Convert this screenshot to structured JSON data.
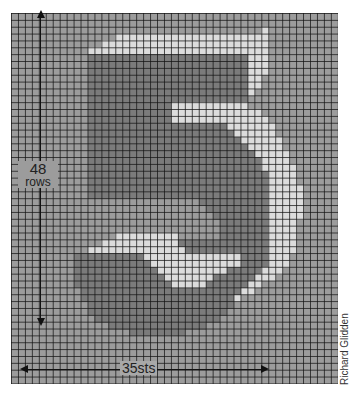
{
  "chart_data": {
    "type": "heatmap",
    "grid": {
      "cols": 47,
      "rows": 54,
      "grid_lines": true
    },
    "legend": {
      "B": {
        "name": "background",
        "color": "#9c9c9c"
      },
      "D": {
        "name": "dark",
        "color": "#7b7b7b"
      },
      "L": {
        "name": "light",
        "color": "#dcdcdc"
      }
    },
    "pattern": [
      "BBBBBBBBBBBBBBBBBBBBBBBBBBBBBBBBBBBBBBBBBBBBBBB",
      "BBBBBBBBBBBBBBBBBBBBBBBBBBBBBBBBBBBBBBBBBBBBBBB",
      "BBBBBBBBBBBBBBBBBBBBBBBBBBBBBBBBBBBBLBBBBBBBBBB",
      "BBBBBBBBBBBBBBBLLLLLLLLLLLLLLLLLLLLLLBBBBBBBBBB",
      "BBBBBBBBBBBBBLLLLLLLLLLLLLLLLLLLLLLLLBBBBBBBBBB",
      "BBBBBBBBBBBLLLLLLLLLLLLLLLLLLLLLLLLLLBBBBBBBBBB",
      "BBBBBBBBBBBDDDDDDDDDDDDDDDDDDDDDDDLLLBBBBBBBBBB",
      "BBBBBBBBBBBDDDDDDDDDDDDDDDDDDDDDDDLLLBBBBBBBBBB",
      "BBBBBBBBBBBDDDDDDDDDDDDDDDDDDDDDDDLLLBBBBBBBBBB",
      "BBBBBBBBBBBDDDDDDDDDDDDDDDDDDDDDDDLLBBBBBBBBBBB",
      "BBBBBBBBBBBDDDDDDDDDDDDDDDDDDDDDDDLLBBBBBBBBBBB",
      "BBBBBBBBBBBDDDDDDDDDDDDDDDDDDDDDDDLBBBBBBBBBBBB",
      "BBBBBBBBBBBDDDDDDDDDDDDDDDDDDDDDDDBBBBBBBBBBBBB",
      "BBBBBBBBBBBDDDDDDDDDDDDLLLLLLLLLLLBBBBBBBBBBBBB",
      "BBBBBBBBBBBDDDDDDDDDDDDLLLLLLLLLLLLLBBBBBBBBBBB",
      "BBBBBBBBBBBDDDDDDDDDDDDLLLLLLLLLLLLLLBBBBBBBBBB",
      "BBBBBBBBBBBDDDDDDDDDDDDDDDDDDDDLLLLLLLBBBBBBBBB",
      "BBBBBBBBBBBDDDDDDDDDDDDDDDDDDDDDLLLLLLBBBBBBBBB",
      "BBBBBBBBBBBDDDDDDDDDDDDDDDDDDDDDDLLLLLLBBBBBBBB",
      "BBBBBBBBBBBDDDDDDDDDDDDDDDDDDDDDDDLLLLLBBBBBBBB",
      "BBBBBBBBBBBDDDDDDDDDDDDDDDDDDDDDDDDLLLLLBBBBBBB",
      "BBBBBBBBBBBDDDDDDDDDDDDDDDDDDDDDDDDDLLLLBBBBBBB",
      "BBBBBBBBBBBDDDDDDDDDDDDDDDDDDDDDDDDDLLLLLBBBBBB",
      "BBBBBBBBBBBDDDDDDDDDDDDDDDDDDDDDDDDDDLLLLBBBBBB",
      "BBBBBBBBBBBDDDDDDDDDDDDDDDDDDDDDDDDDDLLLLBBBBBB",
      "BBBBBBBBBBBDDDDDDDDDDDDDDDDDDDDDDDDDDLLLLLBBBBB",
      "BBBBBBBBBBBDDDDDDDDDDDDDDDDDDDDDDDDDDLLLLLBBBBB",
      "BBBBBBBBBBBBBBBBBBBBBBBBBBBDDDDDDDDDDLLLLLBBBBB",
      "BBBBBBBBBBBBBBBBBBBBBBBBBBBBDDDDDDDDDLLLLLBBBBB",
      "BBBBBBBBBBBBBBBBBBBBBBBBBBBBBDDDDDDDDLLLLLBBBBB",
      "BBBBBBBBBBBBBBBBBBBBBBBBBBBBBBDDDDDDDLLLLBBBBBB",
      "BBBBBBBBBBBBBBBBBBBBBBBBBBBBBBDDDDDDDLLLLBBBBBB",
      "BBBBBBBBBBBBBBBLLLLLLLLLBBBBBBDDDDDDDLLLLBBBBBB",
      "BBBBBBBBBBBBBLLLLLLLLLLLDDDDDDDDDDDDDLLLLBBBBBB",
      "BBBBBBBBBBBLLLLLLLLLLLLLLDDDDDDDDDDDDLLLLBBBBBB",
      "BBBBBBBBBDDDDDDDDDDLLLLLLLLLLLLLLDDDDLLLBBBBBBB",
      "BBBBBBBBBDDDDDDDDDDDLLLLLLLLLLLLLDDDDLLLBBBBBBB",
      "BBBBBBBBBDDDDDDDDDDDDLLLLLLLLLLDDDDDLLLBBBBBBBB",
      "BBBBBBBBBDDDDDDDDDDDDDLLLLLLLDDDDDDLLLBBBBBBBBB",
      "BBBBBBBBBDDDDDDDDDDDDDDLLLLLDDDDDDLLBBBBBBBBBBB",
      "BBBBBBBBBBDDDDDDDDDDDDDDDDDDDDDDDLLBBBBBBBBBBBB",
      "BBBBBBBBBBDDDDDDDDDDDDDDDDDDDDDDLBBBBBBBBBBBBBB",
      "BBBBBBBBBBBDDDDDDDDDDDDDDDDDDDDDBBBBBBBBBBBBBBB",
      "BBBBBBBBBBBDDDDDDDDDDDDDDDDDDDDBBBBBBBBBBBBBBBB",
      "BBBBBBBBBBBBDDDDDDDDDDDDDDDDDDBBBBBBBBBBBBBBBBB",
      "BBBBBBBBBBBBBBDDDDDDDDDDDDDDBBBBBBBBBBBBBBBBBBB",
      "BBBBBBBBBBBBBBBBBDDDDDDDDBBBBBBBBBBBBBBBBBBBBBB",
      "BBBBBBBBBBBBBBBBBBBBBBBBBBBBBBBBBBBBBBBBBBBBBBB",
      "BBBBBBBBBBBBBBBBBBBBBBBBBBBBBBBBBBBBBBBBBBBBBBB",
      "BBBBBBBBBBBBBBBBBBBBBBBBBBBBBBBBBBBBBBBBBBBBBBB",
      "BBBBBBBBBBBBBBBBBBBBBBBBBBBBBBBBBBBBBBBBBBBBBBB",
      "BBBBBBBBBBBBBBBBBBBBBBBBBBBBBBBBBBBBBBBBBBBBBBB",
      "BBBBBBBBBBBBBBBBBBBBBBBBBBBBBBBBBBBBBBBBBBBBBBB",
      "BBBBBBBBBBBBBBBBBBBBBBBBBBBBBBBBBBBBBBBBBBBBBBB"
    ],
    "annotations": {
      "rows": {
        "value": "48",
        "unit": "rows",
        "orientation": "vertical"
      },
      "stitches": {
        "value": "35sts",
        "orientation": "horizontal"
      }
    }
  },
  "labels": {
    "rows_number": "48",
    "rows_unit": "rows",
    "stitches": "35sts",
    "credit": "Richard Glidden"
  }
}
